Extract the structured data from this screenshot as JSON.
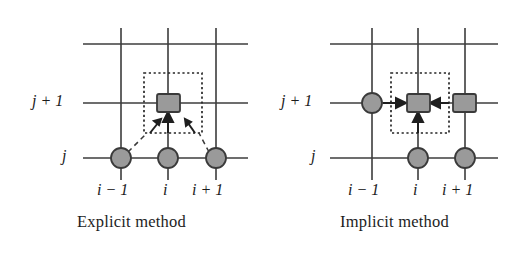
{
  "figure": {
    "background": "#ffffff",
    "width": 526,
    "height": 258
  },
  "colors": {
    "grid_line": "#3c3c3c",
    "node_fill": "#9a9a9a",
    "node_stroke": "#3a3a3a",
    "dotted_box": "#262626",
    "dashed_link": "#3a3a3a",
    "arrow": "#1f1f1f",
    "text": "#1d1d1d"
  },
  "panels": [
    {
      "id": "explicit",
      "caption": "Explicit method",
      "y_axis": {
        "labels": [
          {
            "id": "j-plus-1",
            "text": "j + 1",
            "italic_part": "j",
            "row": "j+1"
          },
          {
            "id": "j",
            "text": "j",
            "italic_part": "j",
            "row": "j"
          }
        ]
      },
      "x_axis": {
        "labels": [
          {
            "id": "i-minus-1",
            "text": "i − 1"
          },
          {
            "id": "i",
            "text": "i"
          },
          {
            "id": "i-plus-1",
            "text": "i + 1"
          }
        ]
      },
      "nodes": [
        {
          "id": "node-unknown-i-jplus1",
          "shape": "square",
          "grid_x": "i",
          "grid_y": "j+1",
          "meaning": "unknown"
        },
        {
          "id": "node-known-iminus1-j",
          "shape": "circle",
          "grid_x": "i-1",
          "grid_y": "j",
          "meaning": "known"
        },
        {
          "id": "node-known-i-j",
          "shape": "circle",
          "grid_x": "i",
          "grid_y": "j",
          "meaning": "known"
        },
        {
          "id": "node-known-iplus1-j",
          "shape": "circle",
          "grid_x": "i+1",
          "grid_y": "j",
          "meaning": "known"
        }
      ],
      "arrows": [
        {
          "id": "arrow-from-iminus1-j",
          "direction": "up-right"
        },
        {
          "id": "arrow-from-i-j",
          "direction": "up"
        },
        {
          "id": "arrow-from-iplus1-j",
          "direction": "up-left"
        }
      ],
      "stencil_box": {
        "id": "stencil-box-explicit",
        "style": "dotted"
      }
    },
    {
      "id": "implicit",
      "caption": "Implicit method",
      "y_axis": {
        "labels": [
          {
            "id": "j-plus-1",
            "text": "j + 1",
            "italic_part": "j",
            "row": "j+1"
          },
          {
            "id": "j",
            "text": "j",
            "italic_part": "j",
            "row": "j"
          }
        ]
      },
      "x_axis": {
        "labels": [
          {
            "id": "i-minus-1",
            "text": "i − 1"
          },
          {
            "id": "i",
            "text": "i"
          },
          {
            "id": "i-plus-1",
            "text": "i + 1"
          }
        ]
      },
      "nodes": [
        {
          "id": "node-known-iminus1-jplus1",
          "shape": "circle",
          "grid_x": "i-1",
          "grid_y": "j+1",
          "meaning": "known"
        },
        {
          "id": "node-unknown-i-jplus1",
          "shape": "square",
          "grid_x": "i",
          "grid_y": "j+1",
          "meaning": "unknown"
        },
        {
          "id": "node-unknown-iplus1-jplus1",
          "shape": "square",
          "grid_x": "i+1",
          "grid_y": "j+1",
          "meaning": "unknown"
        },
        {
          "id": "node-known-i-j",
          "shape": "circle",
          "grid_x": "i",
          "grid_y": "j",
          "meaning": "known"
        },
        {
          "id": "node-known-iplus1-j",
          "shape": "circle",
          "grid_x": "i+1",
          "grid_y": "j",
          "meaning": "known"
        }
      ],
      "arrows": [
        {
          "id": "arrow-from-left",
          "direction": "right"
        },
        {
          "id": "arrow-from-right",
          "direction": "left"
        },
        {
          "id": "arrow-from-below",
          "direction": "up"
        }
      ],
      "stencil_box": {
        "id": "stencil-box-implicit",
        "style": "dotted"
      }
    }
  ]
}
